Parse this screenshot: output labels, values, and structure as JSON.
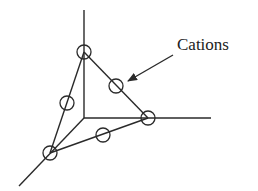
{
  "diagram": {
    "title": "",
    "label": "Cations",
    "colors": {
      "line": "#2a2a2a",
      "background": "#ffffff"
    },
    "origin": [
      84,
      118
    ],
    "axes": [
      {
        "name": "z-axis",
        "from": [
          84,
          118
        ],
        "to": [
          84,
          10
        ]
      },
      {
        "name": "y-axis",
        "from": [
          84,
          118
        ],
        "to": [
          211,
          118
        ]
      },
      {
        "name": "x-axis",
        "from": [
          84,
          118
        ],
        "to": [
          19,
          186
        ]
      }
    ],
    "triangle_vertices": [
      {
        "name": "top-vertex",
        "pos": [
          84,
          52
        ]
      },
      {
        "name": "right-vertex",
        "pos": [
          148,
          118
        ]
      },
      {
        "name": "bottom-left-vertex",
        "pos": [
          50,
          153
        ]
      }
    ],
    "cation_sites": [
      {
        "name": "cation-top-vertex",
        "pos": [
          84,
          52
        ]
      },
      {
        "name": "cation-right-vertex",
        "pos": [
          148,
          118
        ]
      },
      {
        "name": "cation-bottom-left-vertex",
        "pos": [
          50,
          153
        ]
      },
      {
        "name": "cation-top-right-edge",
        "pos": [
          116,
          86
        ]
      },
      {
        "name": "cation-left-edge",
        "pos": [
          67,
          103
        ]
      },
      {
        "name": "cation-bottom-edge",
        "pos": [
          103,
          135
        ]
      }
    ],
    "cation_radius": 7,
    "arrow": {
      "from": [
        173,
        55
      ],
      "to": [
        128,
        81
      ]
    },
    "label_pos": [
      177,
      35
    ]
  }
}
